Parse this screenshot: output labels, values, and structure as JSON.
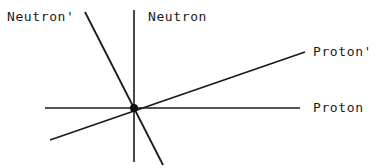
{
  "figure": {
    "kind": "vector-scattering-diagram",
    "background_color": "#ffffff",
    "stroke_color": "#1a1a1a",
    "width": 380,
    "height": 168
  },
  "labels": {
    "neutron_prime": "Neutron'",
    "neutron": "Neutron",
    "proton_prime": "Proton'",
    "proton": "Proton"
  },
  "chart_data": {
    "type": "scatter",
    "title": "",
    "xlabel": "",
    "ylabel": "",
    "grid": false,
    "legend": "none",
    "origin": {
      "x": 134,
      "y": 108,
      "label": "interaction-vertex",
      "dot_radius": 4
    },
    "vectors": [
      {
        "name": "Proton",
        "label": "Proton",
        "role": "incoming-proton-axis",
        "x1": 45,
        "y1": 108,
        "x2": 300,
        "y2": 108,
        "stroke_width": 1.6
      },
      {
        "name": "Neutron",
        "label": "Neutron",
        "role": "incoming-neutron-axis",
        "x1": 134,
        "y1": 10,
        "x2": 134,
        "y2": 162,
        "stroke_width": 1.6
      },
      {
        "name": "Proton'",
        "label": "Proton'",
        "role": "scattered-proton",
        "x1": 50,
        "y1": 140,
        "x2": 305,
        "y2": 52,
        "stroke_width": 1.8
      },
      {
        "name": "Neutron'",
        "label": "Neutron'",
        "role": "scattered-neutron",
        "x1": 85,
        "y1": 12,
        "x2": 163,
        "y2": 165,
        "stroke_width": 1.8
      }
    ],
    "label_positions": [
      {
        "text": "Neutron'",
        "x": 7,
        "y": 10
      },
      {
        "text": "Neutron",
        "x": 148,
        "y": 10
      },
      {
        "text": "Proton'",
        "x": 313,
        "y": 45
      },
      {
        "text": "Proton",
        "x": 313,
        "y": 101
      }
    ]
  }
}
